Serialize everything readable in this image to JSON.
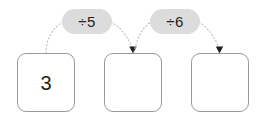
{
  "diagram": {
    "type": "function-machine-flow",
    "title_visible": false,
    "colors": {
      "box_border": "#9a9a9a",
      "box_fill": "#ffffff",
      "pill_fill": "#dcdcdc",
      "text": "#231f20",
      "connector": "#b9b9b9",
      "arrowhead": "#231f20",
      "background": "#ffffff"
    },
    "boxes": [
      {
        "name": "box-1",
        "value": "3",
        "filled": true
      },
      {
        "name": "box-2",
        "value": "",
        "filled": false
      },
      {
        "name": "box-3",
        "value": "",
        "filled": false
      }
    ],
    "operations": [
      {
        "name": "operation-1",
        "label": "÷5"
      },
      {
        "name": "operation-2",
        "label": "÷6"
      }
    ],
    "connectors": [
      {
        "from": "box-1",
        "to": "operation-1",
        "style": "dotted"
      },
      {
        "from": "operation-1",
        "to": "box-2",
        "style": "dotted",
        "arrow": true
      },
      {
        "from": "box-2",
        "to": "operation-2",
        "style": "dotted"
      },
      {
        "from": "operation-2",
        "to": "box-3",
        "style": "dotted",
        "arrow": true
      }
    ]
  }
}
